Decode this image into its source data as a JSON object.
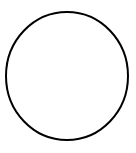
{
  "canvas": {
    "width": 136,
    "height": 153,
    "background_color": "#ffffff",
    "title": "Circle Outline"
  },
  "shape": {
    "name": "circle",
    "type": "ellipse",
    "center_x": 67,
    "center_y": 76,
    "radius_x": 61,
    "radius_y": 64,
    "stroke_color": "#000000",
    "stroke_width": 2,
    "fill": "none"
  }
}
